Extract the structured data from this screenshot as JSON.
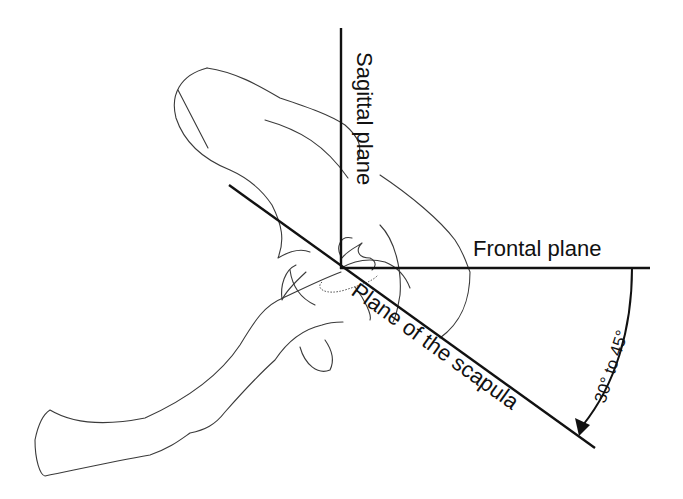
{
  "diagram": {
    "labels": {
      "sagittal": "Sagittal plane",
      "frontal": "Frontal plane",
      "scapular": "Plane of the scapula",
      "angle": "30° to 45°"
    },
    "planes": [
      {
        "name": "Sagittal plane",
        "orientation": "vertical"
      },
      {
        "name": "Frontal plane",
        "orientation": "horizontal"
      },
      {
        "name": "Plane of the scapula",
        "orientation": "oblique",
        "angle_from_frontal": "30° to 45°"
      }
    ],
    "colors": {
      "line": "#111111",
      "outline": "#3a3a3a",
      "background": "#ffffff"
    }
  }
}
